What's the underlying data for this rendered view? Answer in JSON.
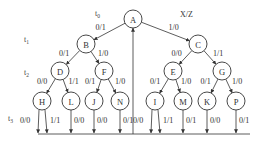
{
  "header_label": "X/Z",
  "time_labels": [
    {
      "id": "t0",
      "base": "t",
      "sub": "0"
    },
    {
      "id": "t1",
      "base": "t",
      "sub": "1"
    },
    {
      "id": "t2",
      "base": "t",
      "sub": "2"
    },
    {
      "id": "t3",
      "base": "t",
      "sub": "3"
    }
  ],
  "nodes": [
    {
      "id": "A",
      "label": "A"
    },
    {
      "id": "B",
      "label": "B"
    },
    {
      "id": "C",
      "label": "C"
    },
    {
      "id": "D",
      "label": "D"
    },
    {
      "id": "F",
      "label": "F"
    },
    {
      "id": "E",
      "label": "E"
    },
    {
      "id": "G",
      "label": "G"
    },
    {
      "id": "H",
      "label": "H"
    },
    {
      "id": "L",
      "label": "L"
    },
    {
      "id": "J",
      "label": "J"
    },
    {
      "id": "N",
      "label": "N"
    },
    {
      "id": "I",
      "label": "I"
    },
    {
      "id": "M",
      "label": "M"
    },
    {
      "id": "K",
      "label": "K"
    },
    {
      "id": "P",
      "label": "P"
    }
  ],
  "edges": [
    {
      "from": "A",
      "to": "B",
      "label": "0/1"
    },
    {
      "from": "A",
      "to": "C",
      "label": "1/0"
    },
    {
      "from": "B",
      "to": "D",
      "label": "0/1"
    },
    {
      "from": "B",
      "to": "F",
      "label": "1/0"
    },
    {
      "from": "C",
      "to": "E",
      "label": "0/0"
    },
    {
      "from": "C",
      "to": "G",
      "label": "1/1"
    },
    {
      "from": "D",
      "to": "H",
      "label": "0/0"
    },
    {
      "from": "D",
      "to": "L",
      "label": "1/1"
    },
    {
      "from": "F",
      "to": "J",
      "label": "0/1"
    },
    {
      "from": "F",
      "to": "N",
      "label": "1/0"
    },
    {
      "from": "E",
      "to": "I",
      "label": "0/1"
    },
    {
      "from": "E",
      "to": "M",
      "label": "1/0"
    },
    {
      "from": "G",
      "to": "K",
      "label": "0/1"
    },
    {
      "from": "G",
      "to": "P",
      "label": "1/0"
    }
  ],
  "leaf_outputs": [
    {
      "from": "H",
      "label": "0/0"
    },
    {
      "from": "H",
      "label": "1/1"
    },
    {
      "from": "L",
      "label": "0/0"
    },
    {
      "from": "J",
      "label": "0/0"
    },
    {
      "from": "N",
      "label": "0/1"
    },
    {
      "from": "I",
      "label": "0/0"
    },
    {
      "from": "I",
      "label": "1/1"
    },
    {
      "from": "M",
      "label": "0/1"
    },
    {
      "from": "K",
      "label": "0/0"
    },
    {
      "from": "P",
      "label": "0/1"
    }
  ]
}
